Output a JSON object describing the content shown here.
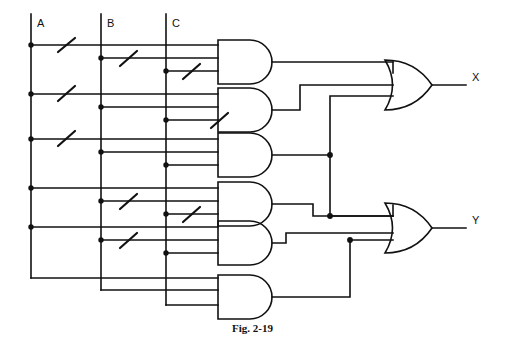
{
  "figure": {
    "caption": "Fig. 2-19",
    "type": "logic-circuit-diagram"
  },
  "inputs": [
    {
      "name": "A",
      "label": "A",
      "bus_x": 31
    },
    {
      "name": "B",
      "label": "B",
      "bus_x": 101
    },
    {
      "name": "C",
      "label": "C",
      "bus_x": 166
    }
  ],
  "outputs": [
    {
      "name": "X",
      "label": "X"
    },
    {
      "name": "Y",
      "label": "Y"
    }
  ],
  "and_gates": [
    {
      "id": "and1",
      "y": 62,
      "inputs": [
        "A'",
        "B'",
        "C'"
      ]
    },
    {
      "id": "and2",
      "y": 110,
      "inputs": [
        "A'",
        "B",
        "C'"
      ]
    },
    {
      "id": "and3",
      "y": 155,
      "inputs": [
        "A",
        "B",
        "C"
      ]
    },
    {
      "id": "and4",
      "y": 204,
      "inputs": [
        "A",
        "B'",
        "C'"
      ]
    },
    {
      "id": "and5",
      "y": 243,
      "inputs": [
        "A",
        "B'",
        "C"
      ]
    },
    {
      "id": "and6",
      "y": 297,
      "inputs": [
        "A",
        "B",
        "C"
      ]
    }
  ],
  "or_gates": [
    {
      "id": "or_x",
      "y": 85,
      "output": "X",
      "sources": [
        "and1",
        "and2",
        "and3"
      ]
    },
    {
      "id": "or_y",
      "y": 228,
      "output": "Y",
      "sources": [
        "and4",
        "and5",
        "and6"
      ]
    }
  ],
  "inversion_marks": 8,
  "junction_dots": 17,
  "colors": {
    "line": "#111111",
    "background": "#ffffff",
    "text": "#111111"
  }
}
